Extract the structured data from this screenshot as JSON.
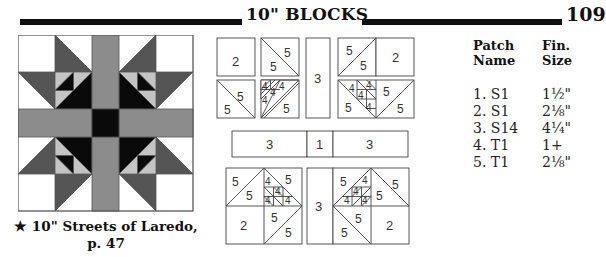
{
  "header": {
    "title": "10\" BLOCKS",
    "page_number": "109"
  },
  "block": {
    "caption_line1": "★ 10\" Streets of Laredo,",
    "caption_line2": "p. 47",
    "colors": {
      "white": "#ffffff",
      "dark_gray": "#555555",
      "medium_gray": "#8c8c8c",
      "light_gray": "#c4c4c4",
      "black": "#0a0a0a",
      "outline": "#555555"
    }
  },
  "pattern_diagram": {
    "top_left": {
      "square": "2",
      "hst": [
        "5",
        "5"
      ],
      "hst2": [
        "5",
        "5"
      ],
      "small": [
        "4",
        "4",
        "4",
        "4"
      ],
      "big": "5"
    },
    "top_strip": "3",
    "top_right": {
      "hst": [
        "5",
        "5"
      ],
      "square": "2",
      "small": [
        "4",
        "4",
        "4",
        "4"
      ],
      "big": [
        "5",
        "5",
        "5"
      ]
    },
    "middle_row": [
      "3",
      "1",
      "3"
    ],
    "bottom_left": {
      "hst": [
        "5",
        "5"
      ],
      "small": [
        "4",
        "4",
        "4",
        "4"
      ],
      "big": "5",
      "square": "2",
      "hst2": [
        "5",
        "5"
      ]
    },
    "bottom_strip": "3",
    "bottom_right": {
      "small": [
        "4",
        "4",
        "4",
        "4"
      ],
      "hst_top": [
        "5",
        "5",
        "5"
      ],
      "hst2": [
        "5",
        "5"
      ],
      "square": "2"
    }
  },
  "patch_table": {
    "headers": {
      "name_line1": "Patch",
      "name_line2": "Name",
      "size_line1": "Fin.",
      "size_line2": "Size"
    },
    "rows": [
      {
        "name": "1. S1",
        "size": "1½\""
      },
      {
        "name": "2. S1",
        "size": "2⅛\""
      },
      {
        "name": "3. S14",
        "size": "4¼\""
      },
      {
        "name": "4. T1",
        "size": "1+"
      },
      {
        "name": "5. T1",
        "size": "2⅛\""
      }
    ]
  }
}
